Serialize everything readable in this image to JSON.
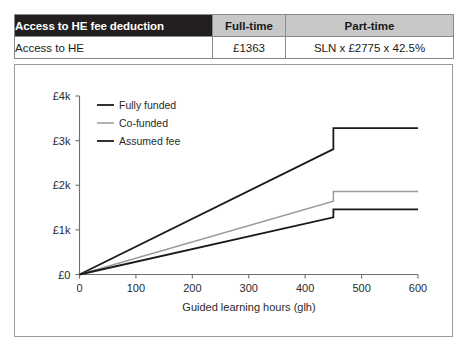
{
  "table": {
    "headers": [
      "Access to HE fee deduction",
      "Full-time",
      "Part-time"
    ],
    "rows": [
      {
        "label": "Access to HE",
        "full_time": "£1363",
        "part_time": "SLN x £2775 x 42.5%"
      }
    ]
  },
  "chart_data": {
    "type": "line",
    "title": "",
    "xlabel": "Guided learning hours (glh)",
    "ylabel": "",
    "xlim": [
      0,
      600
    ],
    "ylim": [
      0,
      4000
    ],
    "xticks": [
      0,
      100,
      200,
      300,
      400,
      500,
      600
    ],
    "xticklabels": [
      "0",
      "100",
      "200",
      "300",
      "400",
      "500",
      "600"
    ],
    "yticks": [
      0,
      1000,
      2000,
      3000,
      4000
    ],
    "yticklabels": [
      "£0",
      "£1k",
      "£2k",
      "£3k",
      "£4k"
    ],
    "grid": false,
    "legend_position": "upper-left",
    "step_x": 450,
    "series": [
      {
        "name": "Fully funded",
        "color": "#1a1a1a",
        "width": 1.8,
        "x": [
          0,
          450,
          450,
          600
        ],
        "values": [
          0,
          2810,
          3280,
          3280
        ]
      },
      {
        "name": "Co-funded",
        "color": "#9a9a9a",
        "width": 1.5,
        "x": [
          0,
          450,
          450,
          600
        ],
        "values": [
          0,
          1640,
          1860,
          1860
        ]
      },
      {
        "name": "Assumed fee",
        "color": "#1a1a1a",
        "width": 1.8,
        "x": [
          0,
          450,
          450,
          600
        ],
        "values": [
          0,
          1280,
          1460,
          1460
        ]
      }
    ]
  },
  "colors": {
    "header_dark": "#231f20",
    "header_grey": "#c8c8c8",
    "border": "#8a8a8a",
    "axis": "#6e6e6e"
  }
}
